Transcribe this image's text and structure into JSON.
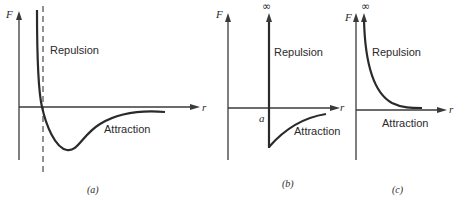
{
  "figure": {
    "panels": [
      {
        "id": "a",
        "caption": "(a)",
        "y_axis_label": "F",
        "x_axis_label": "r",
        "repulsion_label": "Repulsion",
        "attraction_label": "Attraction",
        "description": "Continuous force curve: strongly repulsive at small r, crosses zero, reaches minimum (attractive well), then approaches zero"
      },
      {
        "id": "b",
        "caption": "(b)",
        "y_axis_label": "F",
        "x_axis_label": "r",
        "infinity_label": "∞",
        "origin_label": "a",
        "repulsion_label": "Repulsion",
        "attraction_label": "Attraction",
        "description": "Hard-sphere wall at r = a (infinite repulsion) with attractive tail beyond"
      },
      {
        "id": "c",
        "caption": "(c)",
        "y_axis_label": "F",
        "x_axis_label": "r",
        "infinity_label": "∞",
        "repulsion_label": "Repulsion",
        "attraction_label": "Attraction",
        "description": "Purely repulsive force decaying from infinity toward zero"
      }
    ]
  },
  "colors": {
    "ink": "#2a2a2a",
    "background": "#ffffff"
  }
}
